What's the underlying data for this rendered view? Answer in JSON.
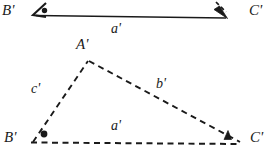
{
  "figure": {
    "background_color": "#ffffff",
    "stroke_color": "#1a1a1a",
    "width": 277,
    "height": 165
  },
  "construction": {
    "base_segment": {
      "name": "copied-base-segment",
      "label": "a'",
      "from_label": "B'",
      "to_label": "C'",
      "line_style": "solid",
      "has_arrowhead": true,
      "x1": 36,
      "y1": 14,
      "x2": 224,
      "y2": 17
    },
    "marks": {
      "dot_mark": "●",
      "triangle_mark": "▲"
    }
  },
  "triangle": {
    "name": "triangle-a-b-c-prime",
    "line_style": "dashed",
    "vertices": [
      {
        "key": "A",
        "label": "A'",
        "x": 88,
        "y": 60,
        "label_x": 78,
        "label_y": 38
      },
      {
        "key": "B",
        "label": "B'",
        "x": 33,
        "y": 142,
        "label_x": 6,
        "label_y": 132
      },
      {
        "key": "C",
        "label": "C'",
        "x": 240,
        "y": 143,
        "label_x": 250,
        "label_y": 132
      }
    ],
    "sides": [
      {
        "key": "c",
        "label": "c'",
        "between": "A'B'",
        "label_x": 33,
        "label_y": 86
      },
      {
        "key": "b",
        "label": "b'",
        "between": "A'C'",
        "label_x": 158,
        "label_y": 80
      },
      {
        "key": "a",
        "label": "a'",
        "between": "B'C'",
        "label_x": 113,
        "label_y": 120
      }
    ],
    "angles": [
      {
        "at": "B'",
        "mark": "dot",
        "mark_glyph": "●"
      },
      {
        "at": "C'",
        "mark": "triangle",
        "mark_glyph": "▲"
      }
    ]
  },
  "labels": {
    "top_segment_label": "a'",
    "top_segment_label_x": 113,
    "top_segment_label_y": 22,
    "top_left_vertex": "B'",
    "top_left_vertex_x": 2,
    "top_left_vertex_y": 4,
    "top_right_vertex": "C'",
    "top_right_vertex_x": 250,
    "top_right_vertex_y": 4
  }
}
